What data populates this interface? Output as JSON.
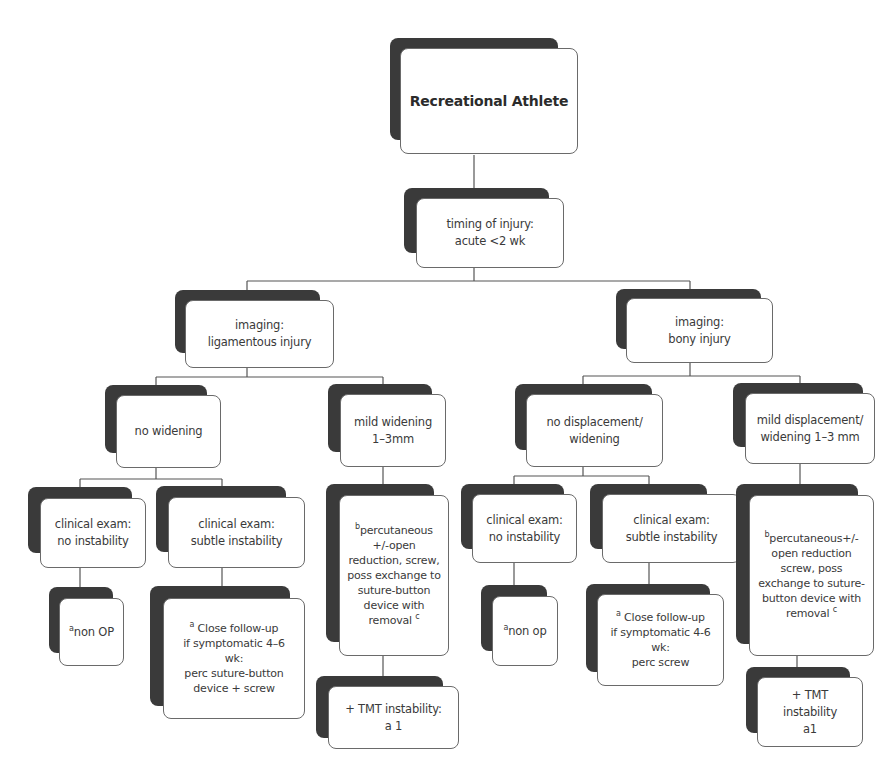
{
  "title": "Recreational Athlete",
  "colors": {
    "shadow": "#3a3a3a",
    "card_fill": "#ffffff",
    "card_border": "#6a6a6a",
    "connector": "#555555",
    "text": "#3a3a3a"
  },
  "nodes": {
    "root": {
      "text": "Recreational Athlete"
    },
    "timing": {
      "text": "timing of injury:\nacute  <2 wk"
    },
    "imaging_lig": {
      "text": "imaging:\nligamentous injury"
    },
    "imaging_bony": {
      "text": "imaging:\nbony injury"
    },
    "lig_no_widening": {
      "text": "no widening"
    },
    "lig_mild_widening": {
      "text": "mild widening\n1–3mm"
    },
    "bony_no_displacement": {
      "text": "no displacement/\nwidening"
    },
    "bony_mild_displacement": {
      "text": "mild displacement/\nwidening 1–3 mm"
    },
    "lig_exam_no_instability": {
      "text": "clinical exam:\nno instability"
    },
    "lig_exam_subtle_instability": {
      "text": "clinical exam:\nsubtle instability"
    },
    "lig_perc": {
      "sup_pre": "b",
      "text": "percutaneous\n+/-open\nreduction, screw,\nposs exchange to\nsuture-button\ndevice with\nremoval ",
      "sup_post": "c"
    },
    "bony_exam_no_instability": {
      "text": "clinical exam:\nno instability"
    },
    "bony_exam_subtle_instability": {
      "text": "clinical exam:\nsubtle instability"
    },
    "bony_perc": {
      "sup_pre": "b",
      "text": "percutaneous+/-\nopen reduction\nscrew, poss\nexchange to suture-\nbutton device with\nremoval ",
      "sup_post": "c"
    },
    "lig_non_op": {
      "sup_pre": "a",
      "text": "non OP"
    },
    "lig_close_followup": {
      "sup_pre": "a",
      "text": " Close follow-up\nif symptomatic 4–6\nwk:\nperc suture-button\ndevice + screw"
    },
    "lig_tmt": {
      "text": "+ TMT instability:\na 1"
    },
    "bony_non_op": {
      "sup_pre": "a",
      "text": "non op"
    },
    "bony_close_followup": {
      "sup_pre": "a",
      "text": " Close follow-up\nif symptomatic 4-6\nwk:\nperc screw"
    },
    "bony_tmt": {
      "text": "+ TMT instability\na1"
    }
  }
}
